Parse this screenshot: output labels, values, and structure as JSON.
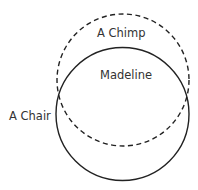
{
  "diagram": {
    "type": "venn",
    "circles": [
      {
        "name": "dashed-circle",
        "label": "A Chimp",
        "style": "dashed",
        "cx": 123,
        "cy": 80,
        "r": 66
      },
      {
        "name": "solid-circle",
        "label": "A Chair",
        "style": "solid",
        "cx": 122.5,
        "cy": 114,
        "r": 66
      }
    ],
    "labels": {
      "chimp": "A Chimp",
      "madeline": "Madeline",
      "chair": "A Chair"
    },
    "colors": {
      "stroke": "#222222",
      "text": "#333333",
      "background": "#ffffff"
    }
  }
}
